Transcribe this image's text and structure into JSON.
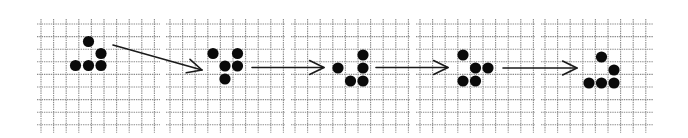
{
  "diagram": {
    "background": "#ffffff",
    "grid_color": "#8c8c8c",
    "cell_color": "#0a0a0a",
    "arrow_color": "#1a1a1a",
    "cell_size": 12.6,
    "grid_top": 24,
    "rows": 9,
    "panels": [
      {
        "id": "gen-0",
        "x_start": 37,
        "x_end": 160,
        "cells": [
          [
            88.5,
            41.5
          ],
          [
            101,
            53.5
          ],
          [
            75.5,
            65.5
          ],
          [
            88.5,
            65.5
          ],
          [
            101,
            65.5
          ]
        ]
      },
      {
        "id": "gen-1",
        "x_start": 166,
        "x_end": 285,
        "cells": [
          [
            213,
            53.5
          ],
          [
            237.5,
            53.5
          ],
          [
            225,
            66
          ],
          [
            237.5,
            66
          ],
          [
            225,
            79
          ]
        ]
      },
      {
        "id": "gen-2",
        "x_start": 291,
        "x_end": 410,
        "cells": [
          [
            363,
            55
          ],
          [
            338,
            68
          ],
          [
            363,
            68
          ],
          [
            350.5,
            81
          ],
          [
            363,
            81
          ]
        ]
      },
      {
        "id": "gen-3",
        "x_start": 416,
        "x_end": 535,
        "cells": [
          [
            463,
            55
          ],
          [
            475.5,
            68
          ],
          [
            488,
            68
          ],
          [
            463,
            81
          ],
          [
            475.5,
            81
          ]
        ]
      },
      {
        "id": "gen-4",
        "x_start": 541,
        "x_end": 653,
        "cells": [
          [
            601.5,
            57
          ],
          [
            614,
            70
          ],
          [
            589,
            83
          ],
          [
            601.5,
            83
          ],
          [
            614,
            83
          ]
        ]
      }
    ],
    "arrows": [
      {
        "id": "arrow-1",
        "from": [
          113,
          45
        ],
        "to": [
          202,
          70
        ]
      },
      {
        "id": "arrow-2",
        "from": [
          252,
          67.5
        ],
        "to": [
          324,
          67.5
        ]
      },
      {
        "id": "arrow-3",
        "from": [
          376,
          67.5
        ],
        "to": [
          448,
          67.5
        ]
      },
      {
        "id": "arrow-4",
        "from": [
          503,
          68
        ],
        "to": [
          577,
          68
        ]
      }
    ]
  }
}
